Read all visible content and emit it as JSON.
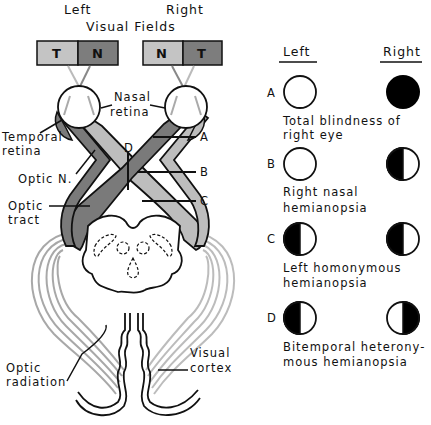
{
  "header": {
    "left_label": "Left",
    "right_label": "Right",
    "title": "Visual Fields"
  },
  "visual_field_boxes": {
    "left": [
      {
        "letter": "T",
        "color": "#c4c4c4"
      },
      {
        "letter": "N",
        "color": "#7d7d7d"
      }
    ],
    "right": [
      {
        "letter": "N",
        "color": "#c4c4c4"
      },
      {
        "letter": "T",
        "color": "#7d7d7d"
      }
    ]
  },
  "anatomy_labels": {
    "nasal_retina_1": "Nasal",
    "nasal_retina_2": "retina",
    "temporal_retina_1": "Temporal",
    "temporal_retina_2": "retina",
    "optic_nerve": "Optic N.",
    "optic_tract_1": "Optic",
    "optic_tract_2": "tract",
    "optic_radiation_1": "Optic",
    "optic_radiation_2": "radiation",
    "visual_cortex_1": "Visual",
    "visual_cortex_2": "cortex"
  },
  "lesion_markers": {
    "A": "A",
    "B": "B",
    "C": "C",
    "D": "D"
  },
  "legend": {
    "left_header": "Left",
    "right_header": "Right",
    "rows": [
      {
        "marker": "A",
        "left": "clear",
        "right": "full",
        "desc_1": "Total blindness of",
        "desc_2": "right eye"
      },
      {
        "marker": "B",
        "left": "clear",
        "right": "left-half",
        "desc_1": "Right nasal",
        "desc_2": "hemianopsia"
      },
      {
        "marker": "C",
        "left": "left-half",
        "right": "left-half",
        "desc_1": "Left homonymous",
        "desc_2": "hemianopsia"
      },
      {
        "marker": "D",
        "left": "left-half",
        "right": "right-half",
        "desc_1": "Bitemporal heterony-",
        "desc_2": "mous hemianopsia"
      }
    ]
  },
  "colors": {
    "dark_pathway": "#7a7a7a",
    "light_pathway": "#bdbdbd",
    "radiation": "#a8a8a8",
    "ink": "#111111"
  }
}
